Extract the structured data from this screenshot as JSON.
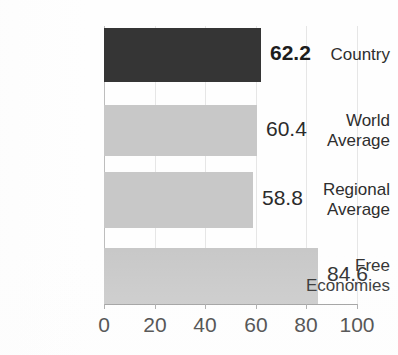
{
  "chart_data": {
    "type": "bar",
    "orientation": "horizontal",
    "title": "Economic Freedom Score",
    "title_cropped": true,
    "xlabel": "",
    "ylabel": "",
    "categories": [
      "Country",
      "World Average",
      "Regional Average",
      "Free Economies"
    ],
    "values": [
      62.2,
      60.4,
      58.8,
      84.6
    ],
    "value_labels": [
      "62.2",
      "60.4",
      "58.8",
      "84.6"
    ],
    "xlim": [
      0,
      100
    ],
    "xticks": [
      0,
      20,
      40,
      60,
      80,
      100
    ],
    "xtick_labels": [
      "0",
      "20",
      "40",
      "60",
      "80",
      "100"
    ],
    "grid": true,
    "grid_axis": "x",
    "legend": false,
    "series": [
      {
        "name": "Score",
        "values": [
          62.2,
          60.4,
          58.8,
          84.6
        ]
      }
    ],
    "bar_colors": [
      "#353535",
      "#c8c8c8",
      "#c8c8c8",
      "#c8c8c8"
    ],
    "highlighted_category": "Country",
    "bars": [
      {
        "label": "Country",
        "label_lines": [
          "Country"
        ],
        "value": 62.2,
        "value_label": "62.2",
        "color": "#353535",
        "emphasis": true,
        "top": 2,
        "height": 54
      },
      {
        "label": "World Average",
        "label_lines": [
          "World",
          "Average"
        ],
        "value": 60.4,
        "value_label": "60.4",
        "color": "#c8c8c8",
        "emphasis": false,
        "top": 79,
        "height": 51
      },
      {
        "label": "Regional Average",
        "label_lines": [
          "Regional",
          "Average"
        ],
        "value": 58.8,
        "value_label": "58.8",
        "color": "#c8c8c8",
        "emphasis": false,
        "top": 146,
        "height": 56
      },
      {
        "label": "Free Economies",
        "label_lines": [
          "Free",
          "Economies"
        ],
        "value": 84.6,
        "value_label": "84.6",
        "color": "#c8c8c8",
        "emphasis": false,
        "top": 222,
        "height": 56
      }
    ]
  },
  "colors": {
    "bar_highlight": "#353535",
    "bar_default": "#c8c8c8",
    "gridline": "#e6e6e6",
    "axis": "#9a9a9a",
    "text": "#2e2e2e",
    "background": "#fefefe"
  }
}
